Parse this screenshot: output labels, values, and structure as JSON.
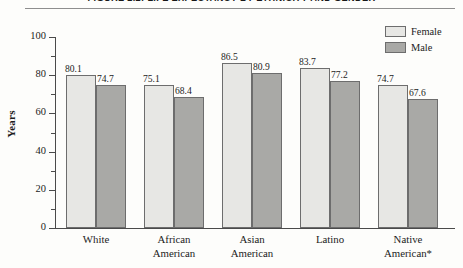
{
  "figure": {
    "title": "FIGURE 2.2: LIFE EXPECTANCY BY ETHNICITY AND GENDER"
  },
  "legend": {
    "position": "top-right",
    "entries": [
      {
        "label": "Female",
        "color": "#e7e7e4"
      },
      {
        "label": "Male",
        "color": "#a9a9a6"
      }
    ]
  },
  "axes": {
    "ylabel": "Years",
    "yticks": [
      "100",
      "80",
      "60",
      "40",
      "20",
      "0"
    ]
  },
  "chart_data": {
    "type": "bar",
    "title": "FIGURE 2.2: LIFE EXPECTANCY BY ETHNICITY AND GENDER",
    "xlabel": "",
    "ylabel": "Years",
    "ylim": [
      0,
      100
    ],
    "yticks": [
      0,
      20,
      40,
      60,
      80,
      100
    ],
    "grid": false,
    "legend_position": "top-right",
    "categories": [
      "White",
      "African American",
      "Asian American",
      "Latino",
      "Native American*"
    ],
    "category_lines": [
      [
        "White"
      ],
      [
        "African",
        "American"
      ],
      [
        "Asian",
        "American"
      ],
      [
        "Latino"
      ],
      [
        "Native",
        "American*"
      ]
    ],
    "series": [
      {
        "name": "Female",
        "color": "#e7e7e4",
        "values": [
          80.1,
          75.1,
          86.5,
          83.7,
          74.7
        ],
        "labels": [
          "80.1",
          "75.1",
          "86.5",
          "83.7",
          "74.7"
        ]
      },
      {
        "name": "Male",
        "color": "#a9a9a6",
        "values": [
          74.7,
          68.4,
          80.9,
          77.2,
          67.6
        ],
        "labels": [
          "74.7",
          "68.4",
          "80.9",
          "77.2",
          "67.6"
        ]
      }
    ]
  }
}
